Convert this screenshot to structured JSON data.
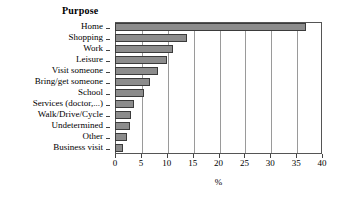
{
  "chart_data": {
    "type": "bar",
    "orientation": "horizontal",
    "title": "Purpose",
    "xlabel": "%",
    "ylabel": "",
    "xlim": [
      0,
      40
    ],
    "xticks": [
      0,
      5,
      10,
      15,
      20,
      25,
      30,
      35,
      40
    ],
    "grid": "vertical",
    "legend": "none",
    "categories": [
      "Home",
      "Shopping",
      "Work",
      "Leisure",
      "Visit someone",
      "Bring/get someone",
      "School",
      "Services (doctor,...)",
      "Walk/Drive/Cycle",
      "Undetermined",
      "Other",
      "Business visit"
    ],
    "values": [
      37.0,
      14.0,
      11.2,
      10.0,
      8.3,
      6.8,
      5.6,
      3.7,
      3.1,
      2.9,
      2.4,
      1.6
    ],
    "bar_color": "#8c8c8c",
    "bar_border_color": "#3b3b3b",
    "frame_color": "#555555",
    "gridline_color": "#9a9a9a"
  }
}
